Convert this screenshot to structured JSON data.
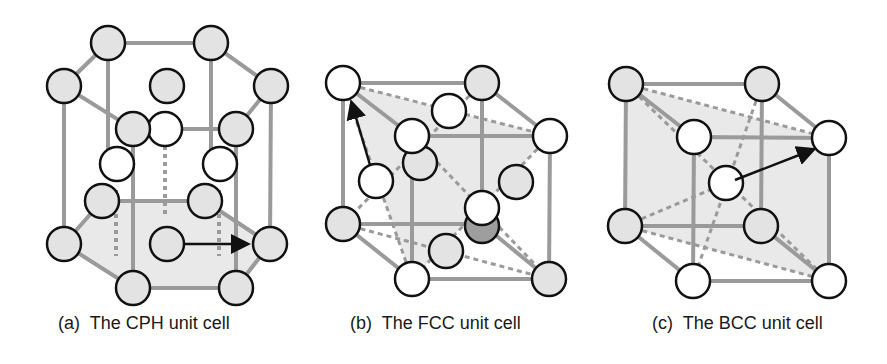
{
  "figures": [
    {
      "id": "a",
      "caption": "(a)  The CPH unit cell",
      "structure": "CPH"
    },
    {
      "id": "b",
      "caption": "(b)  The FCC unit cell",
      "structure": "FCC"
    },
    {
      "id": "c",
      "caption": "(c)  The BCC unit cell",
      "structure": "BCC"
    }
  ],
  "colors": {
    "edge": "#9a9a9a",
    "atom_gray": "#e3e3e3",
    "atom_white": "#ffffff",
    "atom_dark": "#9e9e9e",
    "outline": "#111111",
    "shade": "#e9e9e9",
    "arrow": "#111111"
  }
}
